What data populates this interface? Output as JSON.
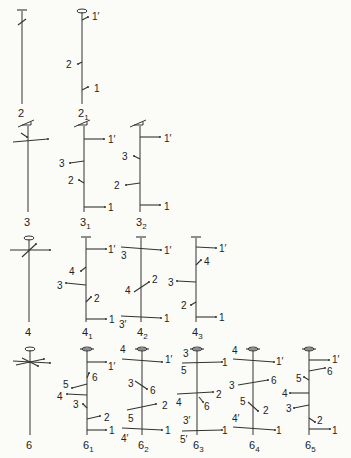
{
  "diagrams": [
    {
      "id": "2",
      "label": "2",
      "sub": "",
      "x": 22,
      "top": 8,
      "bottom": 104,
      "labelY": 117,
      "head": "flat",
      "branches": [
        {
          "y": 22,
          "dx1": -4,
          "dy1": 3,
          "dx2": 4,
          "dy2": -3,
          "label": "",
          "tick": true
        }
      ]
    },
    {
      "id": "2_1",
      "label": "2",
      "sub": "1",
      "x": 82,
      "top": 9,
      "bottom": 104,
      "labelY": 117,
      "head": "oval",
      "branches": [
        {
          "y": 20,
          "x2": 88,
          "y2": 17,
          "label": "1′",
          "lx": 92,
          "ly": 20
        },
        {
          "y": 62,
          "x2": 78,
          "y2": 64,
          "label": "2",
          "lx": 66,
          "ly": 68
        },
        {
          "y": 90,
          "x2": 88,
          "y2": 87,
          "label": "1",
          "lx": 94,
          "ly": 92
        }
      ]
    },
    {
      "id": "3",
      "label": "3",
      "sub": "",
      "x": 28,
      "top": 123,
      "bottom": 212,
      "labelY": 226,
      "head": "flag",
      "branches": [
        {
          "y": 139,
          "x1": 13,
          "x2": 48,
          "y1": 142,
          "y2": 139,
          "label": ""
        },
        {
          "y": 136,
          "x1": 21,
          "x2": 27,
          "y1": 133,
          "y2": 137,
          "label": ""
        }
      ]
    },
    {
      "id": "3_1",
      "label": "3",
      "sub": "1",
      "x": 84,
      "top": 123,
      "bottom": 212,
      "labelY": 226,
      "head": "flag",
      "branches": [
        {
          "y": 139,
          "x2": 104,
          "y2": 139,
          "label": "1′",
          "lx": 108,
          "ly": 143
        },
        {
          "y": 161,
          "x2": 70,
          "y2": 163,
          "label": "3",
          "lx": 59,
          "ly": 167
        },
        {
          "y": 183,
          "x2": 79,
          "y2": 180,
          "label": "2",
          "lx": 68,
          "ly": 184
        },
        {
          "y": 207,
          "x2": 105,
          "y2": 207,
          "label": "1",
          "lx": 108,
          "ly": 211
        }
      ]
    },
    {
      "id": "3_2",
      "label": "3",
      "sub": "2",
      "x": 140,
      "top": 123,
      "bottom": 212,
      "labelY": 226,
      "head": "flag",
      "branches": [
        {
          "y": 137,
          "x2": 160,
          "y2": 137,
          "label": "1′",
          "lx": 164,
          "ly": 142
        },
        {
          "y": 159,
          "x2": 134,
          "y2": 156,
          "label": "3",
          "lx": 122,
          "ly": 160
        },
        {
          "y": 183,
          "x2": 126,
          "y2": 185,
          "label": "2",
          "lx": 114,
          "ly": 189
        },
        {
          "y": 205,
          "x2": 160,
          "y2": 205,
          "label": "1",
          "lx": 164,
          "ly": 210
        }
      ]
    },
    {
      "id": "4",
      "label": "4",
      "sub": "",
      "x": 29,
      "top": 236,
      "bottom": 322,
      "labelY": 336,
      "head": "oval",
      "branches": [
        {
          "y": 250,
          "x1": 10,
          "x2": 50,
          "y1": 250,
          "y2": 250,
          "label": ""
        },
        {
          "y": 250,
          "x1": 22,
          "x2": 36,
          "y1": 257,
          "y2": 244,
          "label": ""
        }
      ]
    },
    {
      "id": "4_1",
      "label": "4",
      "sub": "1",
      "x": 86,
      "top": 235,
      "bottom": 322,
      "labelY": 336,
      "head": "flat",
      "branches": [
        {
          "y": 249,
          "x2": 106,
          "y2": 249,
          "label": "1′",
          "lx": 108,
          "ly": 253
        },
        {
          "y": 267,
          "x2": 81,
          "y2": 271,
          "label": "4",
          "lx": 69,
          "ly": 275
        },
        {
          "y": 285,
          "x2": 66,
          "y2": 283,
          "label": "3",
          "lx": 57,
          "ly": 289
        },
        {
          "y": 302,
          "x2": 91,
          "y2": 297,
          "label": "2",
          "lx": 94,
          "ly": 302
        },
        {
          "y": 319,
          "x2": 106,
          "y2": 319,
          "label": "1",
          "lx": 109,
          "ly": 323
        }
      ]
    },
    {
      "id": "4_2",
      "label": "4",
      "sub": "2",
      "x": 141,
      "top": 235,
      "bottom": 322,
      "labelY": 336,
      "head": "flat",
      "branches": [
        {
          "y": 248,
          "x1": 121,
          "y1": 247,
          "x2": 161,
          "y2": 250,
          "label": "1′",
          "lx": 164,
          "ly": 254,
          "label2": "3",
          "l2x": 121,
          "l2y": 259
        },
        {
          "y": 287,
          "x1": 134,
          "y1": 292,
          "x2": 149,
          "y2": 282,
          "label": "2",
          "lx": 152,
          "ly": 283,
          "label2": "4",
          "l2x": 125,
          "l2y": 294
        },
        {
          "y": 317,
          "x1": 121,
          "y1": 316,
          "x2": 161,
          "y2": 318,
          "label": "1",
          "lx": 164,
          "ly": 322,
          "label2": "3′",
          "l2x": 119,
          "l2y": 328
        }
      ]
    },
    {
      "id": "4_3",
      "label": "4",
      "sub": "3",
      "x": 196,
      "top": 235,
      "bottom": 322,
      "labelY": 336,
      "head": "flat",
      "branches": [
        {
          "y": 247,
          "x2": 216,
          "y2": 248,
          "label": "1′",
          "lx": 219,
          "ly": 252
        },
        {
          "y": 265,
          "x2": 201,
          "y2": 260,
          "label": "4",
          "lx": 204,
          "ly": 265
        },
        {
          "y": 282,
          "x2": 177,
          "y2": 281,
          "label": "3",
          "lx": 168,
          "ly": 286
        },
        {
          "y": 302,
          "x2": 191,
          "y2": 305,
          "label": "2",
          "lx": 181,
          "ly": 309
        },
        {
          "y": 317,
          "x2": 216,
          "y2": 317,
          "label": "1",
          "lx": 219,
          "ly": 321
        }
      ]
    },
    {
      "id": "6",
      "label": "6",
      "sub": "",
      "x": 30,
      "top": 347,
      "bottom": 435,
      "labelY": 449,
      "head": "oval",
      "branches": [
        {
          "y": 362,
          "x1": 13,
          "x2": 50,
          "y1": 361,
          "y2": 363,
          "label": ""
        },
        {
          "y": 362,
          "x1": 16,
          "x2": 44,
          "y1": 365,
          "y2": 359,
          "label": ""
        },
        {
          "y": 362,
          "x1": 22,
          "x2": 38,
          "y1": 358,
          "y2": 366,
          "label": ""
        }
      ]
    },
    {
      "id": "6_1",
      "label": "6",
      "sub": "1",
      "x": 87,
      "top": 347,
      "bottom": 435,
      "labelY": 449,
      "head": "oval2",
      "branches": [
        {
          "y": 362,
          "x2": 106,
          "y2": 362,
          "label": "1′",
          "lx": 108,
          "ly": 370
        },
        {
          "y": 378,
          "x2": 89,
          "y2": 373,
          "label": "6",
          "lx": 92,
          "ly": 381
        },
        {
          "y": 384,
          "x2": 72,
          "y2": 388,
          "label": "5",
          "lx": 63,
          "ly": 388
        },
        {
          "y": 395,
          "x2": 67,
          "y2": 394,
          "label": "4",
          "lx": 57,
          "ly": 400
        },
        {
          "y": 408,
          "x2": 83,
          "y2": 404,
          "label": "3",
          "lx": 73,
          "ly": 408
        },
        {
          "y": 419,
          "x2": 100,
          "y2": 416,
          "label": "2",
          "lx": 104,
          "ly": 421
        },
        {
          "y": 430,
          "x2": 106,
          "y2": 430,
          "label": "1",
          "lx": 109,
          "ly": 434
        }
      ]
    },
    {
      "id": "6_2",
      "label": "6",
      "sub": "2",
      "x": 142,
      "top": 347,
      "bottom": 435,
      "labelY": 449,
      "head": "oval2",
      "branches": [
        {
          "y": 360,
          "x1": 122,
          "y1": 359,
          "x2": 162,
          "y2": 362,
          "label": "1′",
          "lx": 165,
          "ly": 363,
          "label2": "4",
          "l2x": 120,
          "l2y": 353
        },
        {
          "y": 386,
          "x1": 135,
          "y1": 381,
          "x2": 147,
          "y2": 389,
          "label": "6",
          "lx": 150,
          "ly": 394,
          "label2": "3",
          "l2x": 128,
          "l2y": 387
        },
        {
          "y": 405,
          "x1": 127,
          "y1": 410,
          "x2": 156,
          "y2": 404,
          "label": "2",
          "lx": 162,
          "ly": 409,
          "label2": "5",
          "l2x": 128,
          "l2y": 422
        },
        {
          "y": 429,
          "x1": 122,
          "y1": 428,
          "x2": 162,
          "y2": 430,
          "label": "1",
          "lx": 165,
          "ly": 434,
          "label2": "4′",
          "l2x": 121,
          "l2y": 442
        }
      ]
    },
    {
      "id": "6_3",
      "label": "6",
      "sub": "3",
      "x": 197,
      "top": 347,
      "bottom": 435,
      "labelY": 449,
      "head": "oval2",
      "branches": [
        {
          "y": 360,
          "x1": 182,
          "y1": 363,
          "x2": 222,
          "y2": 362,
          "label": "1",
          "lx": 222,
          "ly": 366,
          "label2": "3",
          "l2x": 183,
          "l2y": 357,
          "label3": "5",
          "l3x": 181,
          "l3y": 374
        },
        {
          "y": 395,
          "x1": 177,
          "y1": 394,
          "x2": 213,
          "y2": 392,
          "label": "2",
          "lx": 216,
          "ly": 398,
          "label2": "4",
          "l2x": 176,
          "l2y": 406
        },
        {
          "y": 396,
          "x1": 199,
          "y1": 397,
          "x2": 203,
          "y2": 402,
          "label": "6",
          "lx": 204,
          "ly": 410
        },
        {
          "y": 428,
          "x1": 182,
          "y1": 431,
          "x2": 222,
          "y2": 430,
          "label": "1",
          "lx": 222,
          "ly": 434,
          "label2": "3′",
          "l2x": 183,
          "l2y": 424,
          "label3": "5′",
          "l3x": 180,
          "l3y": 443
        }
      ]
    },
    {
      "id": "6_4",
      "label": "6",
      "sub": "4",
      "x": 253,
      "top": 347,
      "bottom": 435,
      "labelY": 449,
      "head": "oval2",
      "branches": [
        {
          "y": 360,
          "x1": 233,
          "y1": 359,
          "x2": 274,
          "y2": 362,
          "label": "1′",
          "lx": 276,
          "ly": 365,
          "label2": "4",
          "l2x": 232,
          "l2y": 354
        },
        {
          "y": 383,
          "x1": 238,
          "y1": 385,
          "x2": 268,
          "y2": 380,
          "label": "6",
          "lx": 271,
          "ly": 384,
          "label2": "3",
          "l2x": 229,
          "l2y": 389
        },
        {
          "y": 408,
          "x1": 248,
          "y1": 402,
          "x2": 258,
          "y2": 411,
          "label": "2",
          "lx": 263,
          "ly": 414,
          "label2": "5",
          "l2x": 240,
          "l2y": 405
        },
        {
          "y": 428,
          "x1": 233,
          "y1": 427,
          "x2": 275,
          "y2": 430,
          "label": "1",
          "lx": 276,
          "ly": 434,
          "label2": "4′",
          "l2x": 232,
          "l2y": 422
        }
      ]
    },
    {
      "id": "6_5",
      "label": "6",
      "sub": "5",
      "x": 309,
      "top": 347,
      "bottom": 435,
      "labelY": 449,
      "head": "oval2",
      "branches": [
        {
          "y": 360,
          "x2": 329,
          "y2": 360,
          "label": "1′",
          "lx": 332,
          "ly": 363
        },
        {
          "y": 371,
          "x2": 325,
          "y2": 368,
          "label": "6",
          "lx": 327,
          "ly": 375
        },
        {
          "y": 380,
          "x2": 304,
          "y2": 377,
          "label": "5",
          "lx": 296,
          "ly": 382
        },
        {
          "y": 393,
          "x2": 290,
          "y2": 393,
          "label": "4",
          "lx": 282,
          "ly": 397
        },
        {
          "y": 405,
          "x2": 294,
          "y2": 408,
          "label": "3",
          "lx": 286,
          "ly": 412
        },
        {
          "y": 418,
          "x2": 315,
          "y2": 422,
          "label": "2",
          "lx": 317,
          "ly": 424
        },
        {
          "y": 429,
          "x2": 330,
          "y2": 429,
          "label": "1",
          "lx": 332,
          "ly": 434
        }
      ]
    }
  ]
}
